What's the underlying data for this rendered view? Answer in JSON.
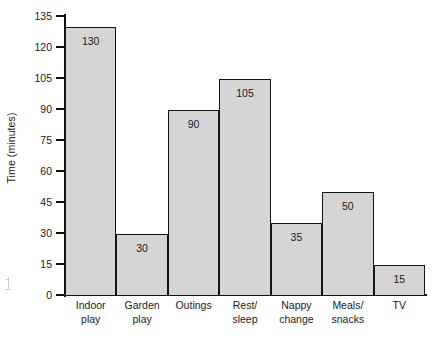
{
  "chart_data": {
    "type": "bar",
    "title": "",
    "xlabel": "",
    "ylabel": "Time (minutes)",
    "categories": [
      "Indoor play",
      "Garden play",
      "Outings",
      "Rest/ sleep",
      "Nappy change",
      "Meals/ snacks",
      "TV"
    ],
    "category_lines": [
      [
        "Indoor",
        "play"
      ],
      [
        "Garden",
        "play"
      ],
      [
        "Outings",
        ""
      ],
      [
        "Rest/",
        "sleep"
      ],
      [
        "Nappy",
        "change"
      ],
      [
        "Meals/",
        "snacks"
      ],
      [
        "TV",
        ""
      ]
    ],
    "values": [
      130,
      30,
      90,
      105,
      35,
      50,
      15
    ],
    "value_labels": [
      "130",
      "30",
      "90",
      "105",
      "35",
      "50",
      "15"
    ],
    "ylim": [
      0,
      135
    ],
    "yticks": [
      0,
      15,
      30,
      45,
      60,
      75,
      90,
      105,
      120,
      135
    ],
    "ytick_labels": [
      "0",
      "15",
      "30",
      "45",
      "60",
      "75",
      "90",
      "105",
      "120",
      "135"
    ],
    "grid": false,
    "legend": false,
    "bar_fill": "#d5d5d5",
    "bar_edge": "#131313",
    "axis_color": "#111111",
    "background": "#ffffff"
  }
}
